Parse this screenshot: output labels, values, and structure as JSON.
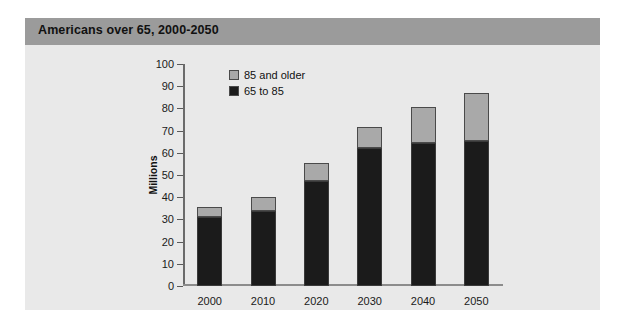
{
  "figure": {
    "title": "Americans over 65, 2000-2050",
    "header_color": "#9b9b9b",
    "panel_color": "#e9e9e9"
  },
  "legend": {
    "position": "top-left-inside-plot",
    "entries": [
      {
        "label": "85 and older",
        "color": "#a9a9a9"
      },
      {
        "label": "65 to 85",
        "color": "#1b1b1b"
      }
    ]
  },
  "axes": {
    "y_label": "Millions",
    "y_ticks": [
      "0",
      "10",
      "20",
      "30",
      "40",
      "50",
      "60",
      "70",
      "80",
      "90",
      "100"
    ],
    "x_ticks": [
      "2000",
      "2010",
      "2020",
      "2030",
      "2040",
      "2050"
    ]
  },
  "chart_data": {
    "type": "bar",
    "title": "Americans over 65, 2000-2050",
    "xlabel": "",
    "ylabel": "Millions",
    "ylim": [
      0,
      100
    ],
    "ytick_step": 10,
    "grid": false,
    "stacked": true,
    "legend_position": "upper left",
    "categories": [
      "2000",
      "2010",
      "2020",
      "2030",
      "2040",
      "2050"
    ],
    "series": [
      {
        "name": "65 to 85",
        "color": "#1b1b1b",
        "values": [
          31,
          34,
          47.5,
          62,
          64.5,
          65.5
        ]
      },
      {
        "name": "85 and older",
        "color": "#a9a9a9",
        "values": [
          4.5,
          6,
          8,
          9.5,
          16,
          21.5
        ]
      }
    ],
    "totals": [
      35.5,
      40,
      55.5,
      71.5,
      80.5,
      87
    ]
  }
}
